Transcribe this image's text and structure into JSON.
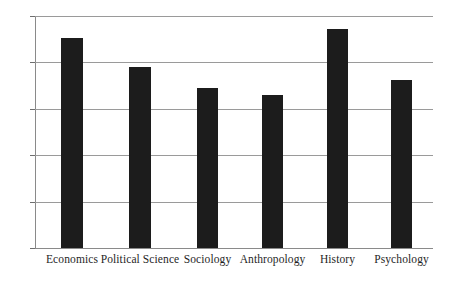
{
  "chart_data": {
    "type": "bar",
    "title": "",
    "subtitle": "",
    "xlabel": "",
    "ylabel": "",
    "categories": [
      "Economics",
      "Political Science",
      "Sociology",
      "Anthropology",
      "History",
      "Psychology"
    ],
    "values": [
      2.26,
      1.95,
      1.72,
      1.65,
      2.36,
      1.81
    ],
    "series": [
      {
        "name": "",
        "values": [
          2.26,
          1.95,
          1.72,
          1.65,
          2.36,
          1.81
        ]
      }
    ],
    "ylim": [
      0,
      2.5
    ],
    "y_ticks": [
      0,
      0.5,
      1,
      1.5,
      2,
      2.5
    ],
    "y_tick_labels": [
      "0",
      "0.5",
      "1",
      "1.5",
      "2",
      "2.5"
    ],
    "grid": true,
    "grid_axis": "y",
    "legend": false,
    "legend_position": "none",
    "bar_color": "#1c1c1c",
    "grid_color": "#9a9a9a",
    "axis_color": "#8a8a8a",
    "background_color": "#ffffff",
    "annotations": []
  }
}
